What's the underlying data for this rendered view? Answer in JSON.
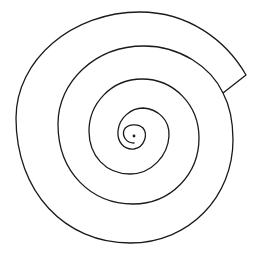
{
  "figure": {
    "background": "#ffffff",
    "stroke_color": "#1a1a1a",
    "stroke_width": 1.3,
    "center_dot": {
      "cx": 134,
      "cy": 136,
      "r": 1.4
    },
    "spiral_path": "M 134 143 C 126 143 122 136 124 130 C 127 124 138 123 143 128 C 148 134 145 147 134 149 C 124 150 117 142 118 131 C 119 118 131 108 143 108 C 158 109 170 120 169 136 C 168 155 152 174 130 174 C 106 174 89 156 89 131 C 89 104 111 79 142 79 C 174 79 199 105 199 138 C 199 174 171 204 133 204 C 92 204 58 173 58 124 C 58 82 95 46 144 46 C 180 46 211 67 223 93 C 231 108 233 124 233 140 C 233 196 190 243 130 243 C 65 243 16 192 16 118 C 16 60 72 12 140 12 C 188 12 226 40 246 75 L 223 93"
  }
}
